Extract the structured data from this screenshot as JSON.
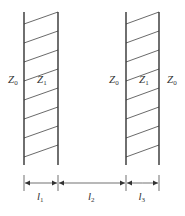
{
  "colors": {
    "line": "#333333",
    "hatch": "#444444",
    "background": "#ffffff"
  },
  "slabs": [
    {
      "name": "slab-1",
      "x1": 24,
      "x2": 58
    },
    {
      "name": "slab-3",
      "x1": 126,
      "x2": 159
    }
  ],
  "geometry": {
    "top": 12,
    "bottom": 165,
    "dim_y": 183
  },
  "media_labels": [
    {
      "main": "Z",
      "sub": "0",
      "x": 8,
      "y": 83
    },
    {
      "main": "Z",
      "sub": "1",
      "x": 37,
      "y": 83
    },
    {
      "main": "Z",
      "sub": "0",
      "x": 109,
      "y": 83
    },
    {
      "main": "Z",
      "sub": "1",
      "x": 139,
      "y": 83
    },
    {
      "main": "Z",
      "sub": "0",
      "x": 167,
      "y": 83
    }
  ],
  "dimensions": [
    {
      "main": "l",
      "sub": "1",
      "from": 24,
      "to": 58
    },
    {
      "main": "l",
      "sub": "2",
      "from": 58,
      "to": 126
    },
    {
      "main": "l",
      "sub": "3",
      "from": 126,
      "to": 159
    }
  ]
}
